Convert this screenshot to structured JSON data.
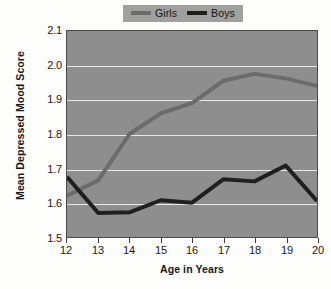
{
  "chart_data": {
    "type": "line",
    "title": "",
    "xlabel": "Age in Years",
    "ylabel": "Mean Depressed Mood Score",
    "xlim": [
      12,
      20
    ],
    "ylim": [
      1.5,
      2.1
    ],
    "xticks": [
      12,
      13,
      14,
      15,
      16,
      17,
      18,
      19,
      20
    ],
    "xtick_labels": [
      "12",
      "13",
      "14",
      "15",
      "16",
      "17",
      "18",
      "19",
      "20"
    ],
    "yticks": [
      1.5,
      1.6,
      1.7,
      1.8,
      1.9,
      2.0,
      2.1
    ],
    "ytick_labels": [
      "1.5",
      "1.6",
      "1.7",
      "1.8",
      "1.9",
      "2.0",
      "2.1"
    ],
    "grid": true,
    "grid_axis": "y",
    "legend_position": "top-center",
    "x": [
      12,
      13,
      14,
      15,
      16,
      17,
      18,
      19,
      20
    ],
    "series": [
      {
        "name": "Girls",
        "color": "#6b6b6b",
        "values": [
          1.62,
          1.665,
          1.8,
          1.86,
          1.89,
          1.955,
          1.975,
          1.962,
          1.94
        ]
      },
      {
        "name": "Boys",
        "color": "#1f1f1f",
        "values": [
          1.675,
          1.57,
          1.572,
          1.607,
          1.6,
          1.668,
          1.662,
          1.708,
          1.605
        ]
      }
    ],
    "plot_background": "#8e8e8e",
    "grid_color": "#e9e9e6",
    "legend_background": "#a0a09e",
    "figure_background": "#fdfdfc"
  },
  "axes": {
    "y_title": "Mean Depressed Mood Score",
    "x_title": "Age in Years"
  },
  "legend": {
    "entries": [
      {
        "label": "Girls",
        "swatch_name": "legend-swatch-girls"
      },
      {
        "label": "Boys",
        "swatch_name": "legend-swatch-boys"
      }
    ]
  }
}
